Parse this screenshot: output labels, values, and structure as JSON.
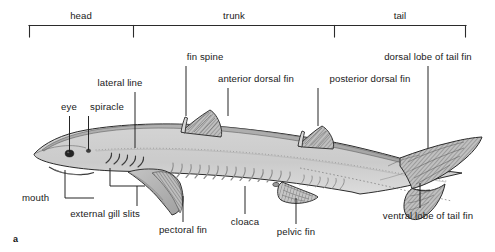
{
  "figure": {
    "panel_letter": "a",
    "colors": {
      "body_fill": "#c9c9c9",
      "body_dark": "#9a9a9a",
      "fin_fill": "#b4b4b4",
      "outline": "#2b2b2b",
      "leader": "#1a1a1a",
      "text": "#1a1a1a",
      "background": "#ffffff"
    }
  },
  "regions": {
    "bracket_label_head": "head",
    "bracket_label_trunk": "trunk",
    "bracket_label_tail": "tail"
  },
  "labels": {
    "eye": "eye",
    "spiracle": "spiracle",
    "lateral_line": "lateral line",
    "fin_spine": "fin spine",
    "anterior_dorsal_fin": "anterior dorsal fin",
    "posterior_dorsal_fin": "posterior dorsal fin",
    "dorsal_lobe_of_tail_fin": "dorsal lobe of tail fin",
    "ventral_lobe_of_tail_fin": "ventral lobe of tail fin",
    "mouth": "mouth",
    "external_gill_slits": "external gill slits",
    "pectoral_fin": "pectoral fin",
    "cloaca": "cloaca",
    "pelvic_fin": "pelvic fin"
  }
}
